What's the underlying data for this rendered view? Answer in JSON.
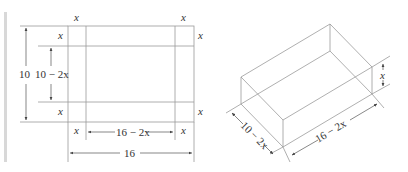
{
  "flat_sheet": {
    "corner_labels": {
      "top_left": "x",
      "top_right": "x",
      "left_top": "x",
      "right_top": "x",
      "left_bottom": "x",
      "right_bottom": "x",
      "bottom_left": "x",
      "bottom_right": "x"
    },
    "height_label": "10",
    "inner_height_label": "10 − 2x",
    "inner_width_label": "16 − 2x",
    "width_label": "16"
  },
  "box": {
    "height_label": "x",
    "depth_label": "10 − 2x",
    "length_label": "16 − 2x"
  },
  "colors": {
    "line": "#9a9a9a",
    "text": "#333333",
    "bar": "#d8d8d8"
  }
}
